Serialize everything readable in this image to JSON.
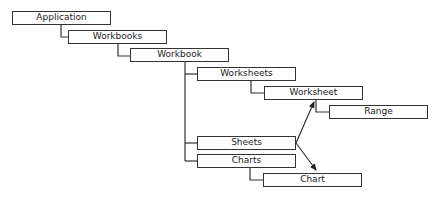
{
  "diagram": {
    "type": "object-hierarchy",
    "nodes": [
      {
        "id": "application",
        "label": "Application",
        "x": 12,
        "y": 11,
        "w": 99
      },
      {
        "id": "workbooks",
        "label": "Workbooks",
        "x": 68,
        "y": 30,
        "w": 99
      },
      {
        "id": "workbook",
        "label": "Workbook",
        "x": 130,
        "y": 48,
        "w": 99
      },
      {
        "id": "worksheets",
        "label": "Worksheets",
        "x": 197,
        "y": 67,
        "w": 99
      },
      {
        "id": "worksheet",
        "label": "Worksheet",
        "x": 264,
        "y": 86,
        "w": 99
      },
      {
        "id": "range",
        "label": "Range",
        "x": 329,
        "y": 105,
        "w": 99
      },
      {
        "id": "sheets",
        "label": "Sheets",
        "x": 197,
        "y": 136,
        "w": 99
      },
      {
        "id": "charts",
        "label": "Charts",
        "x": 197,
        "y": 154,
        "w": 99
      },
      {
        "id": "chart",
        "label": "Chart",
        "x": 263,
        "y": 173,
        "w": 99
      }
    ],
    "edges": [
      {
        "from": "application",
        "to": "workbooks",
        "type": "tree"
      },
      {
        "from": "workbooks",
        "to": "workbook",
        "type": "tree"
      },
      {
        "from": "workbook",
        "to": "worksheets",
        "type": "tree"
      },
      {
        "from": "workbook",
        "to": "sheets",
        "type": "tree"
      },
      {
        "from": "workbook",
        "to": "charts",
        "type": "tree"
      },
      {
        "from": "worksheets",
        "to": "worksheet",
        "type": "tree"
      },
      {
        "from": "worksheet",
        "to": "range",
        "type": "tree"
      },
      {
        "from": "charts",
        "to": "chart",
        "type": "tree"
      },
      {
        "from": "sheets",
        "to": "worksheet",
        "type": "arrow"
      },
      {
        "from": "sheets",
        "to": "chart",
        "type": "arrow"
      }
    ],
    "line_color": "#333333"
  }
}
